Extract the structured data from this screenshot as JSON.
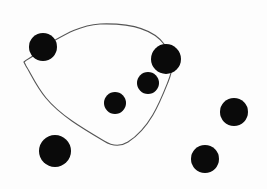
{
  "diagram": {
    "background": "#fdfdfd",
    "dot_color": "#0a0a0a",
    "curve_color": "#555555",
    "dots": [
      {
        "id": "dot-1",
        "cx": 43,
        "cy": 47,
        "r": 14,
        "inside_curve": true
      },
      {
        "id": "dot-2",
        "cx": 166,
        "cy": 59,
        "r": 15,
        "inside_curve": true
      },
      {
        "id": "dot-3",
        "cx": 148,
        "cy": 83,
        "r": 11,
        "inside_curve": true
      },
      {
        "id": "dot-4",
        "cx": 115,
        "cy": 103,
        "r": 11,
        "inside_curve": true
      },
      {
        "id": "dot-5",
        "cx": 55,
        "cy": 151,
        "r": 16,
        "inside_curve": false
      },
      {
        "id": "dot-6",
        "cx": 234,
        "cy": 112,
        "r": 14,
        "inside_curve": false
      },
      {
        "id": "dot-7",
        "cx": 205,
        "cy": 159,
        "r": 14,
        "inside_curve": false
      }
    ],
    "curve_path": "M 24 62 C 28 58, 34 58, 43 47 C 60 38, 75 26, 100 24 C 130 23, 152 28, 164 44 C 176 60, 172 72, 168 82 C 160 102, 150 128, 128 142 C 120 147, 112 146, 104 141 C 82 128, 60 115, 46 98 C 36 86, 30 72, 26 66 Z"
  }
}
